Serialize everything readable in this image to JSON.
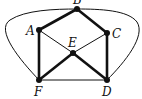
{
  "diagram": {
    "type": "graph",
    "colors": {
      "edge": "#111111",
      "node": "#111111",
      "background": "#ffffff"
    },
    "nodes": [
      {
        "id": "A",
        "label": "A",
        "x": 39,
        "y": 30,
        "lx": 26,
        "ly": 35
      },
      {
        "id": "B",
        "label": "B",
        "x": 77,
        "y": 9,
        "lx": 73,
        "ly": 4
      },
      {
        "id": "C",
        "label": "C",
        "x": 107,
        "y": 33,
        "lx": 112,
        "ly": 38
      },
      {
        "id": "D",
        "label": "D",
        "x": 107,
        "y": 80,
        "lx": 102,
        "ly": 96
      },
      {
        "id": "E",
        "label": "E",
        "x": 73,
        "y": 53,
        "lx": 68,
        "ly": 47
      },
      {
        "id": "F",
        "label": "F",
        "x": 39,
        "y": 80,
        "lx": 34,
        "ly": 96
      }
    ],
    "edges": [
      {
        "from": "A",
        "to": "B",
        "weight": "thick"
      },
      {
        "from": "B",
        "to": "C",
        "weight": "thick"
      },
      {
        "from": "A",
        "to": "F",
        "weight": "thick"
      },
      {
        "from": "C",
        "to": "D",
        "weight": "thick"
      },
      {
        "from": "F",
        "to": "E",
        "weight": "thick"
      },
      {
        "from": "E",
        "to": "D",
        "weight": "thick"
      },
      {
        "from": "A",
        "to": "E",
        "weight": "thin"
      },
      {
        "from": "E",
        "to": "C",
        "weight": "thin"
      },
      {
        "from": "F",
        "to": "D",
        "weight": "thin"
      },
      {
        "from": "F",
        "to": "B",
        "weight": "thin",
        "curved": true,
        "side": "left"
      },
      {
        "from": "B",
        "to": "D",
        "weight": "thin",
        "curved": true,
        "side": "right"
      }
    ]
  }
}
